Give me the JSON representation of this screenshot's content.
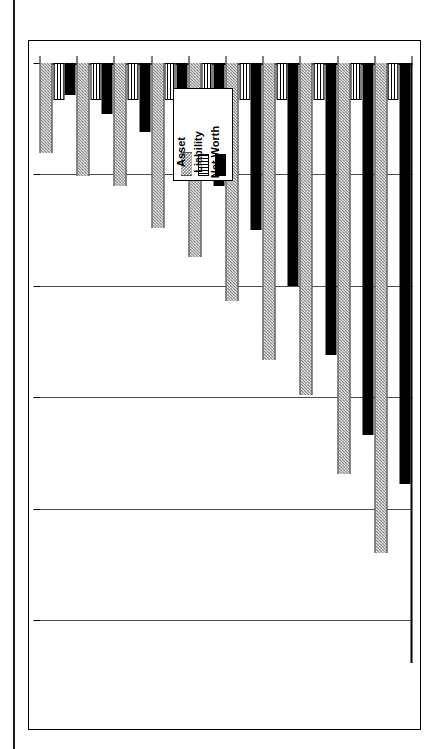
{
  "legend": {
    "entries": [
      {
        "label": "Asset",
        "pattern": "checker",
        "color": "#8c8c8c"
      },
      {
        "label": "Liability",
        "pattern": "vertical-lines",
        "color": "#ffffff"
      },
      {
        "label": "Net Worth",
        "pattern": "solid",
        "color": "#000000"
      }
    ]
  },
  "chart_data": {
    "type": "bar",
    "orientation": "horizontal",
    "title": "",
    "xlabel": "Net Worth (000)",
    "ylabel": "Planning Horizon",
    "axis_title_lines": [
      "Net Worth",
      "(000)"
    ],
    "categories": [
      "87",
      "88",
      "89",
      "90",
      "91",
      "92",
      "93",
      "94",
      "95",
      "96"
    ],
    "tick_labels": [
      "0",
      "500",
      "1000",
      "1500",
      "2000",
      "2500"
    ],
    "ticks": [
      0,
      500,
      1000,
      1500,
      2000,
      2500
    ],
    "xlim": [
      0,
      2500
    ],
    "grid": true,
    "legend_position": "upper-center",
    "series": [
      {
        "name": "Asset",
        "values": [
          405,
          505,
          550,
          740,
          870,
          1070,
          1335,
          1490,
          1845,
          2200
        ]
      },
      {
        "name": "Liability",
        "values": [
          165,
          165,
          165,
          165,
          165,
          165,
          165,
          165,
          165,
          165
        ]
      },
      {
        "name": "Net Worth",
        "values": [
          145,
          230,
          310,
          420,
          550,
          750,
          1000,
          1310,
          1670,
          1890
        ]
      }
    ]
  }
}
